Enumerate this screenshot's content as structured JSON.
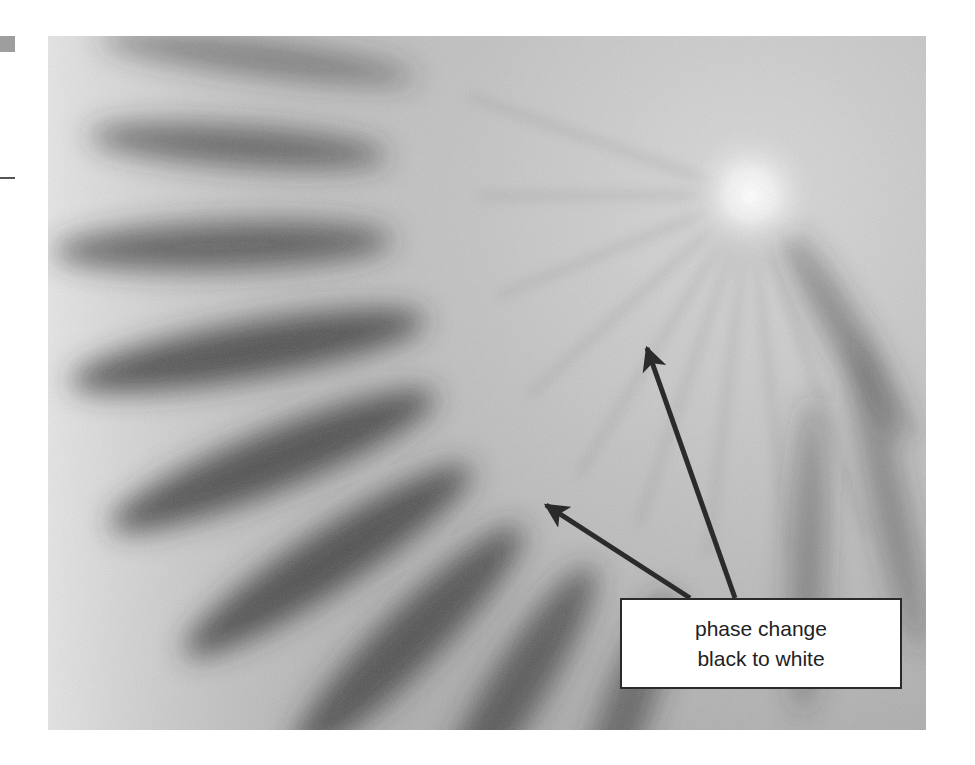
{
  "figure": {
    "bright_spot": {
      "cx": 750,
      "cy": 195
    },
    "colors": {
      "background": "#ffffff",
      "photo_base": "#a8a8a8",
      "band_dark": "#3a3a3a",
      "highlight": "#ffffff",
      "arrow": "#2b2b2b",
      "label_border": "#2a2a2a",
      "label_text": "#222222"
    }
  },
  "annotation": {
    "label_lines": [
      "phase change",
      "black to white"
    ],
    "arrows": [
      {
        "from": [
          735,
          598
        ],
        "to": [
          645,
          343
        ]
      },
      {
        "from": [
          690,
          598
        ],
        "to": [
          541,
          502
        ]
      }
    ]
  }
}
